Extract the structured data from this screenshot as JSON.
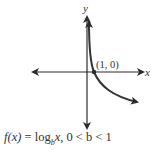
{
  "diagram": {
    "x_axis_label": "x",
    "y_axis_label": "y",
    "point_label": "(1, 0)",
    "colors": {
      "axis": "#2b2b2b",
      "curve": "#333333",
      "text": "#333333"
    }
  },
  "caption": {
    "fx": "f(x)",
    "equals": " = log",
    "base": "b",
    "arg": "x",
    "condition": ", 0 < b < 1"
  }
}
